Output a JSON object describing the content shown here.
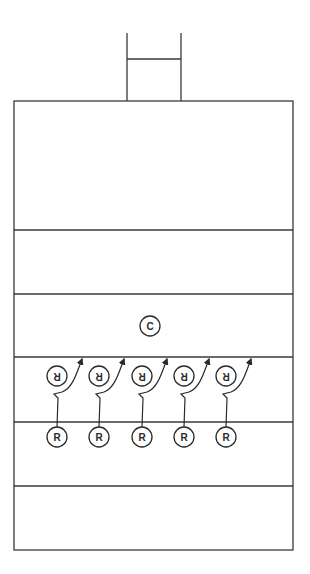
{
  "diagram": {
    "type": "rugby-field-drill",
    "colors": {
      "line": "#3a3a3a",
      "background": "#ffffff"
    },
    "goalposts": {
      "left_x": 127,
      "right_x": 181,
      "top_y": 33,
      "crossbar_y": 59,
      "base_y": 101
    },
    "field": {
      "x": 14,
      "y": 101,
      "width": 279,
      "height": 449
    },
    "horizontal_lines_y": [
      230,
      294,
      357,
      422,
      486
    ],
    "players": {
      "coach": {
        "label": "C",
        "x": 150,
        "y": 326
      },
      "receivers_bottom": [
        {
          "label": "R",
          "x": 57,
          "y": 437
        },
        {
          "label": "R",
          "x": 99,
          "y": 437
        },
        {
          "label": "R",
          "x": 142,
          "y": 437
        },
        {
          "label": "R",
          "x": 184,
          "y": 437
        },
        {
          "label": "R",
          "x": 226,
          "y": 437
        }
      ],
      "receivers_top_inverted": [
        {
          "label": "R",
          "x": 57,
          "y": 376
        },
        {
          "label": "R",
          "x": 99,
          "y": 376
        },
        {
          "label": "R",
          "x": 142,
          "y": 376
        },
        {
          "label": "R",
          "x": 184,
          "y": 376
        },
        {
          "label": "R",
          "x": 226,
          "y": 376
        }
      ]
    }
  }
}
